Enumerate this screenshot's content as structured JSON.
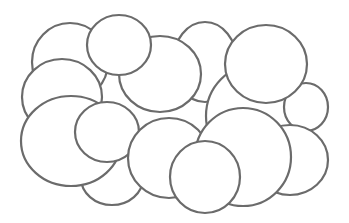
{
  "figure": {
    "width": 349,
    "height": 223,
    "background": "#ffffff",
    "stroke": "#6b6b6b",
    "fill": "#ffffff",
    "stroke_width": 2.2,
    "shapes": [
      {
        "name": "ellipse-top-left-back",
        "cx": 70,
        "cy": 62,
        "rx": 38,
        "ry": 39
      },
      {
        "name": "ellipse-top-center-back",
        "cx": 205,
        "cy": 62,
        "rx": 32,
        "ry": 40
      },
      {
        "name": "ellipse-center-large",
        "cx": 160,
        "cy": 74,
        "rx": 41,
        "ry": 38
      },
      {
        "name": "ellipse-right-big-back",
        "cx": 257,
        "cy": 116,
        "rx": 51,
        "ry": 52
      },
      {
        "name": "ellipse-far-right-small",
        "cx": 306,
        "cy": 107,
        "rx": 22,
        "ry": 24
      },
      {
        "name": "ellipse-right-bottom",
        "cx": 290,
        "cy": 160,
        "rx": 38,
        "ry": 35
      },
      {
        "name": "ellipse-top-small",
        "cx": 119,
        "cy": 45,
        "rx": 32,
        "ry": 30
      },
      {
        "name": "ellipse-top-right-circle",
        "cx": 266,
        "cy": 64,
        "rx": 41,
        "ry": 39
      },
      {
        "name": "ellipse-left-middle",
        "cx": 62,
        "cy": 97,
        "rx": 40,
        "ry": 38
      },
      {
        "name": "ellipse-bottom-small",
        "cx": 112,
        "cy": 178,
        "rx": 31,
        "ry": 27
      },
      {
        "name": "ellipse-left-bottom-large",
        "cx": 71,
        "cy": 141,
        "rx": 50,
        "ry": 45
      },
      {
        "name": "ellipse-inner-small",
        "cx": 107,
        "cy": 132,
        "rx": 32,
        "ry": 30
      },
      {
        "name": "ellipse-bottom-center",
        "cx": 169,
        "cy": 158,
        "rx": 41,
        "ry": 40
      },
      {
        "name": "ellipse-bottom-right-big",
        "cx": 243,
        "cy": 157,
        "rx": 48,
        "ry": 49
      },
      {
        "name": "ellipse-bottom-front-circle",
        "cx": 205,
        "cy": 177,
        "rx": 35,
        "ry": 36
      }
    ]
  }
}
